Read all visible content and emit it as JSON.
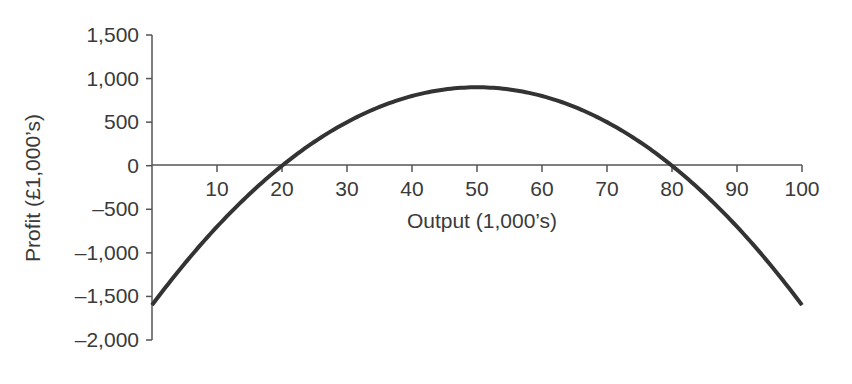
{
  "chart_data": {
    "type": "line",
    "title": "",
    "xlabel": "Output (1,000’s)",
    "ylabel": "Profit (£1,000’s)",
    "x_ticks": [
      10,
      20,
      30,
      40,
      50,
      60,
      70,
      80,
      90,
      100
    ],
    "x_tick_labels": [
      "10",
      "20",
      "30",
      "40",
      "50",
      "60",
      "70",
      "80",
      "90",
      "100"
    ],
    "y_ticks": [
      1500,
      1000,
      500,
      0,
      -500,
      -1000,
      -1500,
      -2000
    ],
    "y_tick_labels": [
      "1,500",
      "1,000",
      "500",
      "0",
      "–500",
      "–1,000",
      "–1,500",
      "–2,000"
    ],
    "xlim": [
      0,
      100
    ],
    "ylim": [
      -2000,
      1500
    ],
    "grid": false,
    "legend": null,
    "series": [
      {
        "name": "Profit",
        "formula": "-(x-20)(x-80)",
        "x": [
          0,
          10,
          20,
          30,
          40,
          50,
          60,
          70,
          80,
          90,
          100
        ],
        "values": [
          -1600,
          -700,
          0,
          500,
          800,
          900,
          800,
          500,
          0,
          -700,
          -1600
        ],
        "color": "#333333"
      }
    ]
  },
  "layout": {
    "x_axis_y_px": 165,
    "y_axis_x_px": 152,
    "x0_px": 152,
    "x100_px": 802,
    "y1500_px": 35,
    "y_minus2000_px": 340
  }
}
